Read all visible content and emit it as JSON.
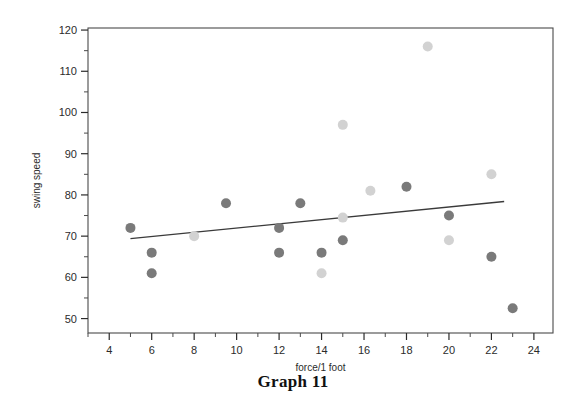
{
  "caption": "Graph 11",
  "chart_data": {
    "type": "scatter",
    "title": "Graph 11",
    "xlabel": "force/1 foot",
    "ylabel": "swing speed",
    "xlim": [
      3.0,
      24.9
    ],
    "ylim": [
      46.5,
      120.5
    ],
    "xticks": [
      4,
      6,
      8,
      10,
      12,
      14,
      16,
      18,
      20,
      22,
      24
    ],
    "xtick_labels": [
      "4",
      "6",
      "8",
      "10",
      "12",
      "14",
      "16",
      "18",
      "20",
      "22",
      "24"
    ],
    "x_minor_tick_step": 1,
    "yticks": [
      50,
      60,
      70,
      80,
      90,
      100,
      110,
      120
    ],
    "ytick_labels": [
      "50",
      "60",
      "70",
      "80",
      "90",
      "100",
      "110",
      "120"
    ],
    "y_minor_tick_step": 5,
    "grid": false,
    "legend": null,
    "frame": true,
    "marker_radius_px": 5,
    "series": [
      {
        "name": "dark-markers",
        "color": "#7a7a7a",
        "points": [
          {
            "x": 5.0,
            "y": 72.0
          },
          {
            "x": 6.0,
            "y": 66.0
          },
          {
            "x": 6.0,
            "y": 61.0
          },
          {
            "x": 9.5,
            "y": 78.0
          },
          {
            "x": 12.0,
            "y": 72.0
          },
          {
            "x": 12.0,
            "y": 66.0
          },
          {
            "x": 13.0,
            "y": 78.0
          },
          {
            "x": 14.0,
            "y": 66.0
          },
          {
            "x": 15.0,
            "y": 69.0
          },
          {
            "x": 18.0,
            "y": 82.0
          },
          {
            "x": 20.0,
            "y": 75.0
          },
          {
            "x": 22.0,
            "y": 65.0
          },
          {
            "x": 23.0,
            "y": 52.5
          }
        ]
      },
      {
        "name": "light-markers",
        "color": "#d2d2d2",
        "points": [
          {
            "x": 8.0,
            "y": 70.0
          },
          {
            "x": 14.0,
            "y": 61.0
          },
          {
            "x": 15.0,
            "y": 74.5
          },
          {
            "x": 15.0,
            "y": 97.0
          },
          {
            "x": 16.3,
            "y": 81.0
          },
          {
            "x": 19.0,
            "y": 116.0
          },
          {
            "x": 20.0,
            "y": 69.0
          },
          {
            "x": 22.0,
            "y": 85.0
          }
        ]
      }
    ],
    "trend_line": {
      "name": "regression-line",
      "color": "#3a3a3a",
      "x0": 5.0,
      "y0": 69.4,
      "x1": 22.6,
      "y1": 78.4
    }
  }
}
